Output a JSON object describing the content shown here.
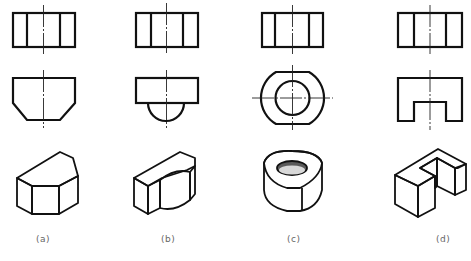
{
  "figure": {
    "type": "orthographic-and-isometric-views",
    "columns": [
      {
        "id": "a",
        "label": "(a)",
        "front_view": "rectangle with two vertical lines",
        "top_view": "chamfered trapezoid",
        "iso": "chamfered block"
      },
      {
        "id": "b",
        "label": "(b)",
        "front_view": "rectangle with two vertical lines",
        "top_view": "rectangle with semicircular boss",
        "iso": "block with half-cylinder"
      },
      {
        "id": "c",
        "label": "(c)",
        "front_view": "rectangle with two vertical lines",
        "top_view": "truncated circle with concentric hole",
        "iso": "ring with flat sides"
      },
      {
        "id": "d",
        "label": "(d)",
        "front_view": "rectangle with two vertical lines",
        "top_view": "rectangle with rectangular notch",
        "iso": "U-shaped block"
      }
    ]
  },
  "labels": {
    "a": "(a)",
    "b": "(b)",
    "c": "(c)",
    "d": "(d)"
  }
}
